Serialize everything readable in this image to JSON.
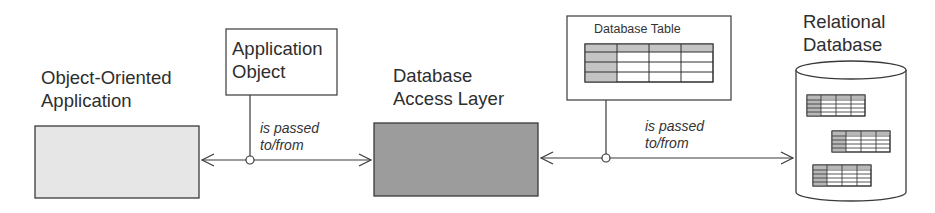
{
  "diagram": {
    "nodes": {
      "oo_app": {
        "label_line1": "Object-Oriented",
        "label_line2": "Application",
        "fill": "#e6e6e6"
      },
      "app_object": {
        "label_line1": "Application",
        "label_line2": "Object"
      },
      "access_layer": {
        "label_line1": "Database",
        "label_line2": "Access Layer",
        "fill": "#9c9c9c"
      },
      "db_table": {
        "label": "Database Table",
        "header_fill": "#c4c4c4",
        "rows": 4,
        "cols": 4
      },
      "rel_db": {
        "label_line1": "Relational",
        "label_line2": "Database",
        "tables": 3
      }
    },
    "edges": [
      {
        "from": "oo_app",
        "to": "access_layer",
        "annotation_line1": "is passed",
        "annotation_line2": "to/from",
        "attached": "app_object",
        "arrows": "both"
      },
      {
        "from": "access_layer",
        "to": "rel_db",
        "annotation_line1": "is passed",
        "annotation_line2": "to/from",
        "attached": "db_table",
        "arrows": "both"
      }
    ],
    "colors": {
      "stroke": "#3a3a3a",
      "background": "#ffffff"
    }
  }
}
